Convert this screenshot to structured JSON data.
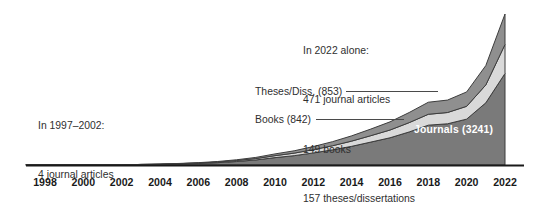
{
  "figure": {
    "name": "stacked-area-publications-by-year",
    "background": "#ffffff"
  },
  "annotations": {
    "early_period": {
      "name": "annotation-1997-2002",
      "lines": [
        "In 1997–2002:",
        "4 journal articles",
        "3 books"
      ]
    },
    "recent_year": {
      "name": "annotation-2022-alone",
      "lines": [
        "In 2022 alone:",
        "471 journal articles",
        "149 books",
        "157 theses/dissertations"
      ]
    }
  },
  "series_labels": {
    "theses": "Theses/Diss. (853)",
    "books": "Books (842)",
    "journals": "Journals (3241)"
  },
  "colors": {
    "journals": "#7a7a7a",
    "books": "#d9d9d9",
    "theses": "#8f8f8f",
    "outline": "#3d3d3d",
    "axis": "#1a1a1a",
    "leader": "#4a4a4a",
    "text": "#2f2f2f",
    "label_on_dark": "#ffffff"
  },
  "chart_data": {
    "type": "area",
    "stacked": true,
    "title": "",
    "xlabel": "",
    "ylabel": "",
    "grid": false,
    "legend": "inline-callouts",
    "xlim": [
      1997,
      2022
    ],
    "ylim": [
      0,
      800
    ],
    "tick_labels": [
      "1998",
      "2000",
      "2002",
      "2004",
      "2006",
      "2008",
      "2010",
      "2012",
      "2014",
      "2016",
      "2018",
      "2020",
      "2022"
    ],
    "x": [
      1997,
      1998,
      1999,
      2000,
      2001,
      2002,
      2003,
      2004,
      2005,
      2006,
      2007,
      2008,
      2009,
      2010,
      2011,
      2012,
      2013,
      2014,
      2015,
      2016,
      2017,
      2018,
      2019,
      2020,
      2021,
      2022
    ],
    "series": [
      {
        "name": "Journals (3241)",
        "key": "journals",
        "color": "#7a7a7a",
        "total": 3241,
        "value_2022": 471,
        "values": [
          1,
          1,
          1,
          1,
          0,
          0,
          2,
          3,
          5,
          8,
          12,
          18,
          26,
          38,
          48,
          62,
          78,
          96,
          118,
          140,
          170,
          205,
          212,
          236,
          320,
          471
        ]
      },
      {
        "name": "Books (842)",
        "key": "books",
        "color": "#d9d9d9",
        "total": 842,
        "value_2022": 149,
        "values": [
          0,
          1,
          1,
          1,
          0,
          0,
          1,
          1,
          2,
          2,
          3,
          5,
          7,
          10,
          13,
          17,
          21,
          27,
          33,
          40,
          48,
          56,
          58,
          66,
          92,
          149
        ]
      },
      {
        "name": "Theses/Diss. (853)",
        "key": "theses",
        "color": "#8f8f8f",
        "total": 853,
        "value_2022": 157,
        "values": [
          0,
          0,
          0,
          0,
          0,
          0,
          0,
          1,
          1,
          2,
          3,
          4,
          6,
          9,
          12,
          16,
          21,
          27,
          34,
          42,
          52,
          62,
          64,
          74,
          100,
          157
        ]
      }
    ]
  }
}
